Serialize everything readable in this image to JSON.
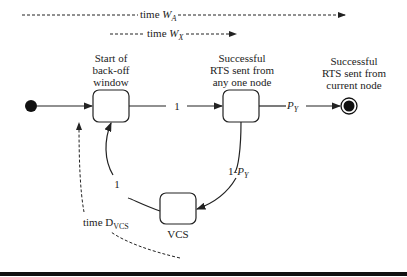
{
  "timelines": {
    "wa": {
      "prefix": "time ",
      "var": "W",
      "sub": "A"
    },
    "wx": {
      "prefix": "time ",
      "var": "W",
      "sub": "X"
    },
    "dvcs": {
      "prefix": "time D",
      "sub": "VCS"
    }
  },
  "nodes": {
    "start_backoff": {
      "line1": "Start of",
      "line2": "back-off",
      "line3": "window"
    },
    "rts_any": {
      "line1": "Successful",
      "line2": "RTS sent from",
      "line3": "any one node"
    },
    "rts_current": {
      "line1": "Successful",
      "line2": "RTS sent from",
      "line3": "current node"
    },
    "vcs": {
      "label": "VCS"
    }
  },
  "edges": {
    "backoff_to_rts": "1",
    "rts_to_current": {
      "var": "P",
      "sub": "Y"
    },
    "rts_to_vcs": {
      "prefix": "1-",
      "var": "P",
      "sub": "Y"
    },
    "vcs_to_backoff": "1"
  },
  "colors": {
    "stroke": "#222222",
    "fill": "#ffffff",
    "bar": "#111111"
  }
}
